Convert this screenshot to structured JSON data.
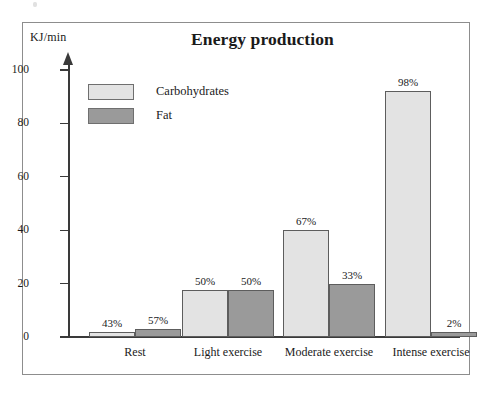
{
  "chart_data": {
    "type": "bar",
    "title": "Energy production",
    "xlabel": "",
    "ylabel": "KJ/min",
    "ylim": [
      0,
      100
    ],
    "yticks": [
      0,
      20,
      40,
      60,
      80,
      100
    ],
    "grid": false,
    "legend_position": "upper-left-inside",
    "categories": [
      "Rest",
      "Light exercise",
      "Moderate exercise",
      "Intense exercise"
    ],
    "series": [
      {
        "name": "Carbohydrates",
        "color": "#e3e3e3",
        "values": [
          2,
          17.5,
          40,
          92
        ],
        "data_labels": [
          "43%",
          "50%",
          "67%",
          "98%"
        ]
      },
      {
        "name": "Fat",
        "color": "#9a9a9a",
        "values": [
          3,
          17.5,
          20,
          2
        ],
        "data_labels": [
          "57%",
          "50%",
          "33%",
          "2%"
        ]
      }
    ]
  },
  "axis": {
    "unit_label": "KJ/min",
    "tick_labels": [
      "100",
      "80",
      "60",
      "40",
      "20",
      "0"
    ]
  },
  "legend": {
    "items": [
      {
        "label": "Carbohydrates",
        "color": "#e3e3e3"
      },
      {
        "label": "Fat",
        "color": "#9a9a9a"
      }
    ]
  },
  "colors": {
    "carbohydrates": "#e3e3e3",
    "fat": "#9a9a9a",
    "bar_border": "#5d5d5d",
    "axis": "#3a3a3a",
    "frame": "#8d8d8d"
  }
}
